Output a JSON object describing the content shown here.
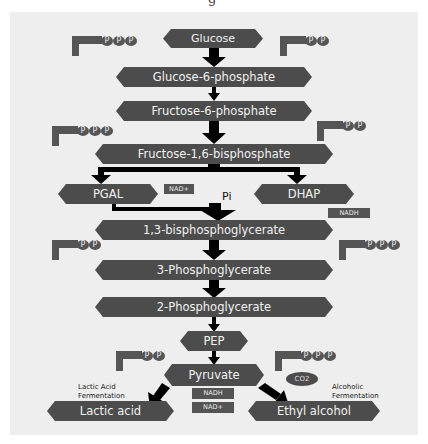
{
  "title_fragment": "g",
  "colors": {
    "node_fill": "#4c4c4c",
    "node_text": "#f2f2f2",
    "panel_bg": "#eeeeee",
    "arrow": "#000000"
  },
  "nodes": {
    "glucose": "Glucose",
    "g6p": "Glucose-6-phosphate",
    "f6p": "Fructose-6-phosphate",
    "f16bp": "Fructose-1,6-bisphosphate",
    "pgal": "PGAL",
    "dhap": "DHAP",
    "bpg13": "1,3-bisphosphoglycerate",
    "pg3": "3-Phosphoglycerate",
    "pg2": "2-Phosphoglycerate",
    "pep": "PEP",
    "pyruvate": "Pyruvate",
    "lactic": "Lactic acid",
    "ethanol": "Ethyl  alcohol"
  },
  "tags": {
    "nad_plus_top": "NAD+",
    "nadh_top": "NADH",
    "nadh_bottom": "NADH",
    "nad_plus_bottom": "NAD+",
    "co2": "CO2"
  },
  "labels": {
    "pi": "Pi",
    "lactic_line1": "Lactic Acid",
    "lactic_line2": "Fermentation",
    "alcoholic_line1": "Alcoholic",
    "alcoholic_line2": "Fermentation"
  },
  "energy_molecules": [
    {
      "id": "atp-1",
      "kind": "ATP",
      "phosphate": "P",
      "count": 3
    },
    {
      "id": "adp-1",
      "kind": "ADP",
      "phosphate": "P",
      "count": 2
    },
    {
      "id": "atp-2",
      "kind": "ATP",
      "phosphate": "P",
      "count": 3
    },
    {
      "id": "adp-2",
      "kind": "ADP",
      "phosphate": "P",
      "count": 2
    },
    {
      "id": "adp-3",
      "kind": "ADP",
      "phosphate": "P",
      "count": 2
    },
    {
      "id": "atp-3",
      "kind": "ATP",
      "phosphate": "P",
      "count": 3
    },
    {
      "id": "adp-4",
      "kind": "ADP",
      "phosphate": "P",
      "count": 2
    },
    {
      "id": "atp-4",
      "kind": "ATP",
      "phosphate": "P",
      "count": 3
    }
  ]
}
